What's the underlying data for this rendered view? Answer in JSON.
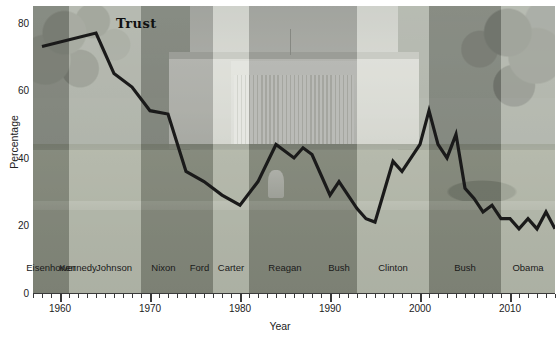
{
  "chart_data": {
    "type": "line",
    "title": "",
    "annotation": "Trust",
    "xlabel": "Year",
    "ylabel": "Percentage",
    "xlim": [
      1957,
      2015
    ],
    "ylim": [
      0,
      85
    ],
    "yticks": [
      0,
      20,
      40,
      60,
      80
    ],
    "xticks_major": [
      1960,
      1970,
      1980,
      1990,
      2000,
      2010
    ],
    "xtick_step_minor": 1,
    "grid": false,
    "legend": "none",
    "series": [
      {
        "name": "Trust",
        "color": "#1a1a1a",
        "x": [
          1958,
          1964,
          1966,
          1968,
          1970,
          1972,
          1974,
          1976,
          1978,
          1980,
          1982,
          1984,
          1986,
          1987,
          1988,
          1990,
          1991,
          1992,
          1993,
          1994,
          1995,
          1996,
          1997,
          1998,
          1999,
          2000,
          2001,
          2002,
          2003,
          2004,
          2005,
          2006,
          2007,
          2008,
          2009,
          2010,
          2011,
          2012,
          2013,
          2014,
          2015
        ],
        "y": [
          73,
          77,
          65,
          61,
          54,
          53,
          36,
          33,
          29,
          26,
          33,
          44,
          40,
          43,
          41,
          29,
          33,
          29,
          25,
          22,
          21,
          30,
          39,
          36,
          40,
          44,
          54,
          44,
          40,
          47,
          31,
          28,
          24,
          26,
          22,
          22,
          19,
          22,
          19,
          24,
          19
        ]
      }
    ],
    "president_bands": [
      {
        "name": "Eisenhower",
        "start": 1957,
        "end": 1961,
        "shade": "dark"
      },
      {
        "name": "Kennedy",
        "start": 1961,
        "end": 1963,
        "shade": "light"
      },
      {
        "name": "Johnson",
        "start": 1963,
        "end": 1969,
        "shade": "light"
      },
      {
        "name": "Nixon",
        "start": 1969,
        "end": 1974,
        "shade": "dark"
      },
      {
        "name": "Ford",
        "start": 1974,
        "end": 1977,
        "shade": "dark"
      },
      {
        "name": "Carter",
        "start": 1977,
        "end": 1981,
        "shade": "light"
      },
      {
        "name": "Reagan",
        "start": 1981,
        "end": 1989,
        "shade": "dark"
      },
      {
        "name": "Bush",
        "start": 1989,
        "end": 1993,
        "shade": "dark"
      },
      {
        "name": "Clinton",
        "start": 1993,
        "end": 2001,
        "shade": "light"
      },
      {
        "name": "Bush",
        "start": 2001,
        "end": 2009,
        "shade": "dark"
      },
      {
        "name": "Obama",
        "start": 2009,
        "end": 2015,
        "shade": "light"
      }
    ],
    "background_image": "white-house-photo"
  }
}
